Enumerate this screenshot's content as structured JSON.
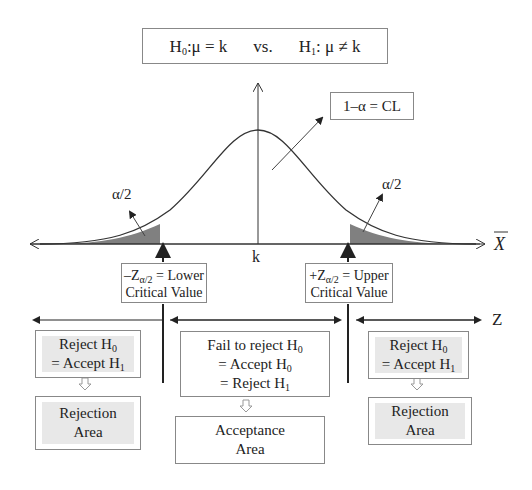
{
  "hypothesis": {
    "h0_label": "H",
    "h0_sub": "0",
    "h0_rest": ":μ = k",
    "vs": "vs.",
    "h1_label": "H",
    "h1_sub": "1",
    "h1_rest": ": μ ≠ k"
  },
  "curve": {
    "confidence_label": "1–α = CL",
    "left_tail_label": "α/2",
    "right_tail_label": "α/2",
    "center_label": "k",
    "x_axis_label": "X",
    "z_axis_label": "Z",
    "tail_color": "#808080"
  },
  "critical_values": {
    "lower": {
      "prefix": "–Z",
      "sub": "α/2",
      "line1_rest": " = Lower",
      "line2": "Critical Value"
    },
    "upper": {
      "prefix": "+Z",
      "sub": "α/2",
      "line1_rest": " = Upper",
      "line2": "Critical Value"
    }
  },
  "regions": {
    "left": {
      "decision_line1": "Reject H",
      "decision_line1_sub": "0",
      "decision_line2": "= Accept H",
      "decision_line2_sub": "1",
      "area_line1": "Rejection",
      "area_line2": "Area"
    },
    "middle": {
      "decision_line1": "Fail to reject H",
      "decision_line1_sub": "0",
      "decision_line2": "= Accept H",
      "decision_line2_sub": "0",
      "decision_line3": "= Reject H",
      "decision_line3_sub": "1",
      "area_line1": "Acceptance",
      "area_line2": "Area"
    },
    "right": {
      "decision_line1": "Reject H",
      "decision_line1_sub": "0",
      "decision_line2": "= Accept H",
      "decision_line2_sub": "1",
      "area_line1": "Rejection",
      "area_line2": "Area"
    }
  }
}
